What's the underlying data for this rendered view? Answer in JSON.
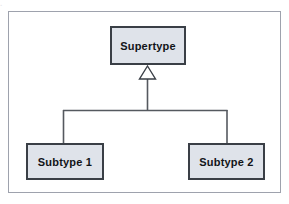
{
  "figure": {
    "kind": "uml-generalization-diagram",
    "background_color": "#ffffff",
    "frame_border_color": "#9ea2ad",
    "top_remnant_text": "."
  },
  "style": {
    "box_fill": "#dfe3ea",
    "box_border": "#3a3f46",
    "line_color": "#55595f",
    "label_color": "#121418",
    "arrow_fill": "#ffffff"
  },
  "nodes": {
    "supertype": {
      "label": "Supertype",
      "role": "supertype"
    },
    "subtype_1": {
      "label": "Subtype 1",
      "role": "subtype"
    },
    "subtype_2": {
      "label": "Subtype 2",
      "role": "subtype"
    }
  },
  "relationships": [
    {
      "type": "generalization",
      "from": "Subtype 1",
      "to": "Supertype",
      "arrowhead": "hollow-triangle"
    },
    {
      "type": "generalization",
      "from": "Subtype 2",
      "to": "Supertype",
      "arrowhead": "hollow-triangle"
    }
  ]
}
